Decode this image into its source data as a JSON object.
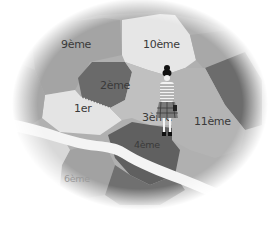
{
  "map": {
    "title": "Illustrated arrondissement map",
    "style": "grayscale hand-drawn",
    "colors": {
      "background": "#ffffff",
      "light_region": "#e6e6e6",
      "mid_region": "#b4b4b4",
      "mid2_region": "#a2a2a2",
      "dark_region": "#6e6e6e",
      "darker_region": "#5e5e5e",
      "river": "#f4f4f4",
      "label": "#3a3a3a"
    },
    "districts": [
      {
        "id": "9",
        "label": "9ème"
      },
      {
        "id": "10",
        "label": "10ème"
      },
      {
        "id": "2",
        "label": "2ème"
      },
      {
        "id": "1",
        "label": "1er"
      },
      {
        "id": "3",
        "label": "3ème"
      },
      {
        "id": "11",
        "label": "11ème"
      },
      {
        "id": "4",
        "label": "4ème"
      },
      {
        "id": "6",
        "label": "6ème"
      }
    ],
    "figure": {
      "description": "small standing woman with black bun, striped top and plaid skirt"
    }
  }
}
